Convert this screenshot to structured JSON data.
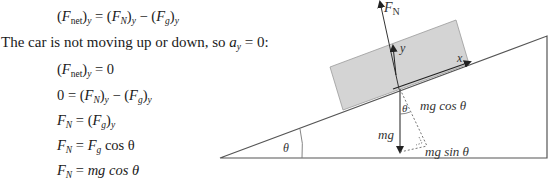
{
  "equations": {
    "line1": {
      "lhs_sym": "F",
      "lhs_sub": "net",
      "lhs_comp": "y",
      "eq": " = ",
      "a_sym": "F",
      "a_sub": "N",
      "a_comp": "y",
      "minus": " − ",
      "b_sym": "F",
      "b_sub": "g",
      "b_comp": "y"
    },
    "statement": {
      "text": "The car is not moving up or down, so ",
      "sym": "a",
      "sub": "y",
      "rest": " = 0:"
    },
    "line2": {
      "sym": "F",
      "sub": "net",
      "comp": "y",
      "rest": " = 0"
    },
    "line3": {
      "zero": "0 = ",
      "a_sym": "F",
      "a_sub": "N",
      "a_comp": "y",
      "minus": " − ",
      "b_sym": "F",
      "b_sub": "g",
      "b_comp": "y"
    },
    "line4": {
      "sym": "F",
      "sub": "N",
      "eq": " = ",
      "r_sym": "F",
      "r_sub": "g",
      "r_comp": "y"
    },
    "line5": {
      "sym": "F",
      "sub": "N",
      "eq": " = ",
      "r_sym": "F",
      "r_sub": "g",
      "r_rest": " cos θ"
    },
    "line6": {
      "sym": "F",
      "sub": "N",
      "eq": " = ",
      "r_rest": "mg cos θ"
    }
  },
  "diagram": {
    "labels": {
      "normal_force_sym": "F",
      "normal_force_sub": "N",
      "y_axis": "y",
      "x_axis": "x",
      "incline_angle": "θ",
      "component_angle": "θ",
      "weight": "mg",
      "perp_component": "mg cos θ",
      "parallel_component": "mg sin θ"
    },
    "colors": {
      "block_fill": "#d4d4d4",
      "block_stroke": "#9a9a9a",
      "line": "#444444"
    }
  }
}
